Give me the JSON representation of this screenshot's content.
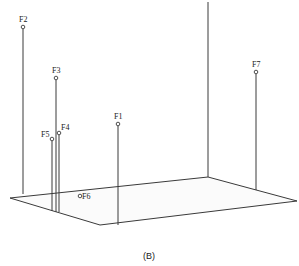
{
  "caption": "(B)",
  "colors": {
    "line": "#3a3a3a",
    "plane_fill": "#fbfbfb",
    "text": "#222222"
  },
  "plane": {
    "corners": [
      [
        10,
        198
      ],
      [
        100,
        225
      ],
      [
        297,
        201
      ],
      [
        208,
        177
      ]
    ]
  },
  "axis": {
    "x": 208,
    "y_top": 2,
    "y_bottom": 177
  },
  "points": [
    {
      "id": "F1",
      "label": "F1",
      "x": 118,
      "y": 124,
      "base_y": 225,
      "label_dx": -4,
      "label_dy": -5
    },
    {
      "id": "F2",
      "label": "F2",
      "x": 23,
      "y": 27,
      "base_y": 194,
      "label_dx": -4,
      "label_dy": -5
    },
    {
      "id": "F3",
      "label": "F3",
      "x": 56,
      "y": 78,
      "base_y": 212,
      "label_dx": -4,
      "label_dy": -5
    },
    {
      "id": "F4",
      "label": "F4",
      "x": 59,
      "y": 133,
      "base_y": 212,
      "label_dx": 2,
      "label_dy": -3
    },
    {
      "id": "F5",
      "label": "F5",
      "x": 52,
      "y": 139,
      "base_y": 211,
      "label_dx": -11,
      "label_dy": -2
    },
    {
      "id": "F6",
      "label": "F6",
      "x": 80,
      "y": 196,
      "base_y": 196,
      "label_dx": 2,
      "label_dy": 3
    },
    {
      "id": "F7",
      "label": "F7",
      "x": 256,
      "y": 72,
      "base_y": 190,
      "label_dx": -4,
      "label_dy": -5
    }
  ]
}
